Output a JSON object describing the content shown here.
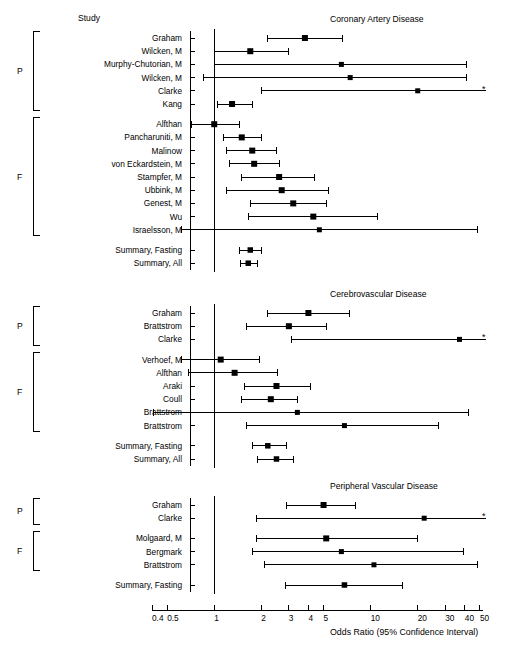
{
  "figure": {
    "study_header": "Study",
    "axis_title": "Odds Ratio (95% Confidence Interval)",
    "group_labels": {
      "prospective": "P",
      "fasting": "F"
    },
    "truncation_marker": "*",
    "colors": {
      "ink": "#000000",
      "background": "#ffffff"
    }
  },
  "chart_data": {
    "type": "forest",
    "title": "",
    "xlabel": "Odds Ratio (95% Confidence Interval)",
    "ylabel": "",
    "xscale": "log",
    "xlim": [
      0.4,
      55
    ],
    "reference_line": 1,
    "grid": false,
    "legend": "none",
    "tick_values": [
      0.4,
      0.5,
      1,
      2,
      3,
      4,
      5,
      10,
      20,
      30,
      40,
      50
    ],
    "tick_labels": [
      "0.4",
      "0.5",
      "1",
      "2",
      "3",
      "4",
      "5",
      "10",
      "20",
      "30",
      "40",
      "50"
    ],
    "panels": [
      {
        "title": "Coronary Artery Disease",
        "groups": [
          {
            "label": "P",
            "rows": [
              {
                "study": "Graham",
                "or": 3.8,
                "lo": 2.2,
                "hi": 6.6,
                "truncated": false
              },
              {
                "study": "Wilcken, M",
                "or": 1.7,
                "lo": 1.0,
                "hi": 3.0,
                "truncated": false
              },
              {
                "study": "Murphy-Chutorian, M",
                "or": 6.5,
                "lo": 1.0,
                "hi": 41.0,
                "truncated": false
              },
              {
                "study": "Wilcken, M",
                "or": 7.4,
                "lo": 0.85,
                "hi": 41.0,
                "truncated": false
              },
              {
                "study": "Clarke",
                "or": 20.0,
                "lo": 2.0,
                "hi": 55.0,
                "truncated": true
              },
              {
                "study": "Kang",
                "or": 1.3,
                "lo": 1.05,
                "hi": 1.75,
                "truncated": false
              }
            ]
          },
          {
            "label": "F",
            "rows": [
              {
                "study": "Alfthan",
                "or": 1.0,
                "lo": 0.72,
                "hi": 1.45,
                "truncated": false
              },
              {
                "study": "Pancharuniti, M",
                "or": 1.5,
                "lo": 1.15,
                "hi": 2.0,
                "truncated": false
              },
              {
                "study": "Malinow",
                "or": 1.75,
                "lo": 1.2,
                "hi": 2.5,
                "truncated": false
              },
              {
                "study": "von Eckardstein, M",
                "or": 1.8,
                "lo": 1.25,
                "hi": 2.6,
                "truncated": false
              },
              {
                "study": "Stampfer, M",
                "or": 2.6,
                "lo": 1.5,
                "hi": 4.4,
                "truncated": false
              },
              {
                "study": "Ubbink, M",
                "or": 2.7,
                "lo": 1.2,
                "hi": 5.4,
                "truncated": false
              },
              {
                "study": "Genest, M",
                "or": 3.2,
                "lo": 1.7,
                "hi": 5.2,
                "truncated": false
              },
              {
                "study": "Wu",
                "or": 4.3,
                "lo": 1.65,
                "hi": 11.0,
                "truncated": false
              },
              {
                "study": "Israelsson, M",
                "or": 4.7,
                "lo": 0.62,
                "hi": 48.0,
                "truncated": false
              }
            ]
          }
        ],
        "summaries": [
          {
            "study": "Summary, Fasting",
            "or": 1.7,
            "lo": 1.45,
            "hi": 2.0
          },
          {
            "study": "Summary, All",
            "or": 1.65,
            "lo": 1.48,
            "hi": 1.9
          }
        ]
      },
      {
        "title": "Cerebrovascular Disease",
        "groups": [
          {
            "label": "P",
            "rows": [
              {
                "study": "Graham",
                "or": 4.0,
                "lo": 2.2,
                "hi": 7.3,
                "truncated": false
              },
              {
                "study": "Brattstrom",
                "or": 3.0,
                "lo": 1.6,
                "hi": 5.2,
                "truncated": false
              },
              {
                "study": "Clarke",
                "or": 37.0,
                "lo": 3.1,
                "hi": 55.0,
                "truncated": true
              }
            ]
          },
          {
            "label": "F",
            "rows": [
              {
                "study": "Verhoef, M",
                "or": 1.1,
                "lo": 0.62,
                "hi": 1.95,
                "truncated": false
              },
              {
                "study": "Alfthan",
                "or": 1.35,
                "lo": 0.68,
                "hi": 2.55,
                "truncated": false
              },
              {
                "study": "Araki",
                "or": 2.5,
                "lo": 1.55,
                "hi": 4.1,
                "truncated": false
              },
              {
                "study": "Coull",
                "or": 2.3,
                "lo": 1.5,
                "hi": 3.4,
                "truncated": false
              },
              {
                "study": "Brattstrom",
                "or": 3.4,
                "lo": 0.41,
                "hi": 42.0,
                "truncated": false
              },
              {
                "study": "Brattstrom",
                "or": 6.8,
                "lo": 1.6,
                "hi": 27.0,
                "truncated": false
              }
            ]
          }
        ],
        "summaries": [
          {
            "study": "Summary, Fasting",
            "or": 2.2,
            "lo": 1.75,
            "hi": 2.9
          },
          {
            "study": "Summary, All",
            "or": 2.5,
            "lo": 1.9,
            "hi": 3.2
          }
        ]
      },
      {
        "title": "Peripheral Vascular Disease",
        "groups": [
          {
            "label": "P",
            "rows": [
              {
                "study": "Graham",
                "or": 5.0,
                "lo": 2.9,
                "hi": 8.0,
                "truncated": false
              },
              {
                "study": "Clarke",
                "or": 22.0,
                "lo": 1.85,
                "hi": 55.0,
                "truncated": true
              }
            ]
          },
          {
            "label": "F",
            "rows": [
              {
                "study": "Molgaard, M",
                "or": 5.2,
                "lo": 1.85,
                "hi": 20.0,
                "truncated": false
              },
              {
                "study": "Bergmark",
                "or": 6.5,
                "lo": 1.75,
                "hi": 39.0,
                "truncated": false
              },
              {
                "study": "Brattstrom",
                "or": 10.5,
                "lo": 2.1,
                "hi": 48.0,
                "truncated": false
              }
            ]
          }
        ],
        "summaries": [
          {
            "study": "Summary, Fasting",
            "or": 6.8,
            "lo": 2.85,
            "hi": 16.0
          }
        ]
      }
    ]
  }
}
